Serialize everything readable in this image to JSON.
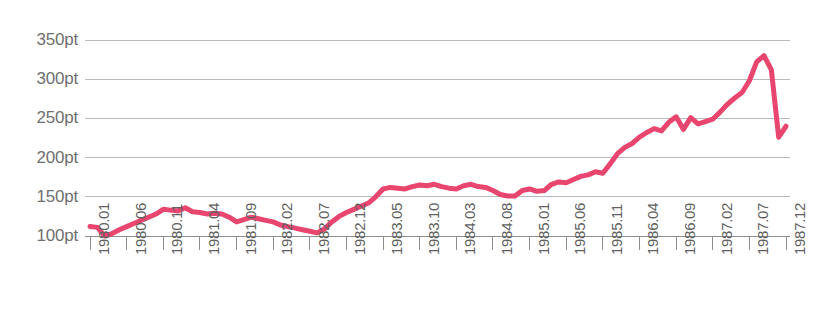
{
  "chart_data": {
    "type": "line",
    "title": "",
    "subtitle": "",
    "xlabel": "",
    "ylabel": "",
    "ylim": [
      85,
      360
    ],
    "grid": true,
    "legend_position": "none",
    "y_ticks": [
      100,
      150,
      200,
      250,
      300,
      350
    ],
    "y_tick_labels": [
      "100pt",
      "150pt",
      "200pt",
      "250pt",
      "300pt",
      "350pt"
    ],
    "y_unit": "pt",
    "x_tick_labels": [
      "1980.01",
      "1980.06",
      "1980.11",
      "1981.04",
      "1981.09",
      "1982.02",
      "1982.07",
      "1982.12",
      "1983.05",
      "1983.10",
      "1984.03",
      "1984.08",
      "1985.01",
      "1985.06",
      "1985.11",
      "1986.04",
      "1986.09",
      "1987.02",
      "1987.07",
      "1987.12"
    ],
    "x_tick_interval_months": 5,
    "x_range": [
      "1980.01",
      "1987.12"
    ],
    "series": [
      {
        "name": "index",
        "color": "#e8456f",
        "line_width": 5,
        "x": [
          "1980.01",
          "1980.02",
          "1980.03",
          "1980.04",
          "1980.05",
          "1980.06",
          "1980.07",
          "1980.08",
          "1980.09",
          "1980.10",
          "1980.11",
          "1980.12",
          "1981.01",
          "1981.02",
          "1981.03",
          "1981.04",
          "1981.05",
          "1981.06",
          "1981.07",
          "1981.08",
          "1981.09",
          "1981.10",
          "1981.11",
          "1981.12",
          "1982.01",
          "1982.02",
          "1982.03",
          "1982.04",
          "1982.05",
          "1982.06",
          "1982.07",
          "1982.08",
          "1982.09",
          "1982.10",
          "1982.11",
          "1982.12",
          "1983.01",
          "1983.02",
          "1983.03",
          "1983.04",
          "1983.05",
          "1983.06",
          "1983.07",
          "1983.08",
          "1983.09",
          "1983.10",
          "1983.11",
          "1983.12",
          "1984.01",
          "1984.02",
          "1984.03",
          "1984.04",
          "1984.05",
          "1984.06",
          "1984.07",
          "1984.08",
          "1984.09",
          "1984.10",
          "1984.11",
          "1984.12",
          "1985.01",
          "1985.02",
          "1985.03",
          "1985.04",
          "1985.05",
          "1985.06",
          "1985.07",
          "1985.08",
          "1985.09",
          "1985.10",
          "1985.11",
          "1985.12",
          "1986.01",
          "1986.02",
          "1986.03",
          "1986.04",
          "1986.05",
          "1986.06",
          "1986.07",
          "1986.08",
          "1986.09",
          "1986.10",
          "1986.11",
          "1986.12",
          "1987.01",
          "1987.02",
          "1987.03",
          "1987.04",
          "1987.05",
          "1987.06",
          "1987.07",
          "1987.08",
          "1987.09",
          "1987.10",
          "1987.11",
          "1987.12"
        ],
        "values": [
          112,
          111,
          100,
          103,
          108,
          112,
          116,
          120,
          124,
          128,
          134,
          133,
          132,
          136,
          131,
          130,
          128,
          129,
          128,
          124,
          118,
          121,
          124,
          122,
          120,
          118,
          114,
          112,
          110,
          108,
          106,
          104,
          109,
          118,
          125,
          130,
          134,
          138,
          142,
          150,
          160,
          162,
          161,
          160,
          163,
          165,
          164,
          166,
          163,
          161,
          160,
          164,
          166,
          163,
          162,
          158,
          153,
          151,
          151,
          158,
          160,
          157,
          158,
          166,
          169,
          168,
          172,
          176,
          178,
          182,
          180,
          192,
          205,
          213,
          218,
          226,
          232,
          237,
          234,
          245,
          252,
          236,
          251,
          243,
          246,
          249,
          258,
          268,
          276,
          283,
          298,
          322,
          330,
          312,
          226,
          240
        ]
      }
    ]
  }
}
